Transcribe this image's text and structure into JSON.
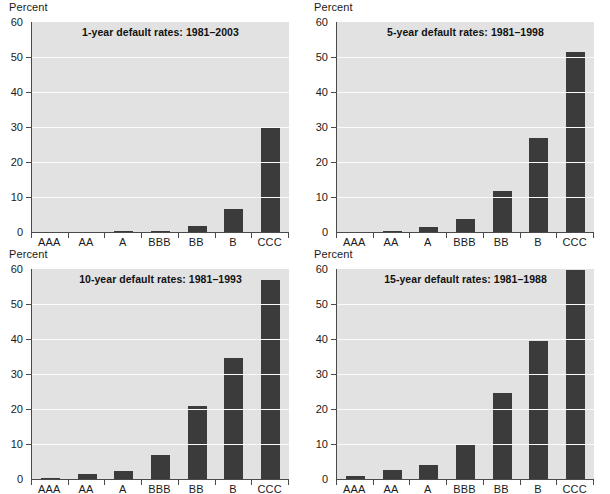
{
  "unit_label": "Percent",
  "chart_data": [
    {
      "type": "bar",
      "title": "1-year default rates: 1981–2003",
      "categories": [
        "AAA",
        "AA",
        "A",
        "BBB",
        "BB",
        "B",
        "CCC"
      ],
      "values": [
        0.0,
        0.0,
        0.2,
        0.3,
        1.7,
        6.7,
        29.6
      ],
      "xlabel": "",
      "ylabel": "Percent",
      "ylim": [
        0,
        60
      ],
      "yticks": [
        0,
        10,
        20,
        30,
        40,
        50,
        60
      ],
      "grid": true,
      "legend": "none"
    },
    {
      "type": "bar",
      "title": "5-year default rates: 1981–1998",
      "categories": [
        "AAA",
        "AA",
        "A",
        "BBB",
        "BB",
        "B",
        "CCC"
      ],
      "values": [
        0.0,
        0.4,
        1.3,
        3.8,
        11.8,
        26.8,
        51.5
      ],
      "xlabel": "",
      "ylabel": "Percent",
      "ylim": [
        0,
        60
      ],
      "yticks": [
        0,
        10,
        20,
        30,
        40,
        50,
        60
      ],
      "grid": true,
      "legend": "none"
    },
    {
      "type": "bar",
      "title": "10-year default rates: 1981–1993",
      "categories": [
        "AAA",
        "AA",
        "A",
        "BBB",
        "BB",
        "B",
        "CCC"
      ],
      "values": [
        0.4,
        1.3,
        2.2,
        6.8,
        20.8,
        34.7,
        56.9
      ],
      "xlabel": "",
      "ylabel": "Percent",
      "ylim": [
        0,
        60
      ],
      "yticks": [
        0,
        10,
        20,
        30,
        40,
        50,
        60
      ],
      "grid": true,
      "legend": "none"
    },
    {
      "type": "bar",
      "title": "15-year default rates: 1981–1988",
      "categories": [
        "AAA",
        "AA",
        "A",
        "BBB",
        "BB",
        "B",
        "CCC"
      ],
      "values": [
        1.0,
        2.5,
        3.9,
        9.6,
        24.5,
        39.5,
        59.8
      ],
      "xlabel": "",
      "ylabel": "Percent",
      "ylim": [
        0,
        60
      ],
      "yticks": [
        0,
        10,
        20,
        30,
        40,
        50,
        60
      ],
      "grid": true,
      "legend": "none"
    }
  ],
  "colors": {
    "bar": "#3b3b3b",
    "plot_background": "#e2e2e2",
    "gridline": "#fbfbfb",
    "axis": "#4a4a4a",
    "text": "#1a1a1a"
  }
}
